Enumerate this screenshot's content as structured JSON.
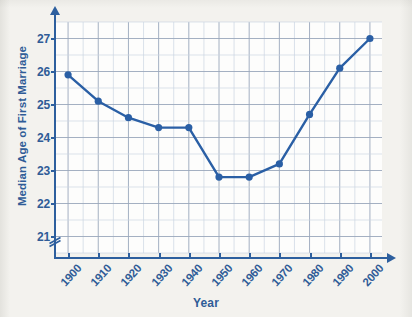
{
  "chart_data": {
    "type": "line",
    "title": "",
    "xlabel": "Year",
    "ylabel": "Median Age of First Marriage",
    "x": [
      1900,
      1910,
      1920,
      1930,
      1940,
      1950,
      1960,
      1970,
      1980,
      1990,
      2000
    ],
    "values": [
      25.9,
      25.1,
      24.6,
      24.3,
      24.3,
      22.8,
      22.8,
      23.2,
      24.7,
      26.1,
      27.0
    ],
    "xtick_labels": [
      "1900",
      "1910",
      "1920",
      "1930",
      "1940",
      "1950",
      "1960",
      "1970",
      "1980",
      "1990",
      "2000"
    ],
    "ytick_labels": [
      "21",
      "22",
      "23",
      "24",
      "25",
      "26",
      "27"
    ],
    "ytick_values": [
      21,
      22,
      23,
      24,
      25,
      26,
      27
    ],
    "xlim": [
      1896,
      2004
    ],
    "ylim": [
      20.5,
      27.5
    ],
    "x_minor_step": 5,
    "y_minor_step": 0.5,
    "grid": true,
    "legend": "none",
    "y_axis_break": true,
    "y_axis_break_symbol": "double-slash",
    "colors": {
      "series_line": "#2a5fa5",
      "marker": "#2a5fa5",
      "axis": "#2d5f9e",
      "label_text": "#2f5c97",
      "grid_major": "#9aa7bb",
      "grid_minor": "#ccd5e2",
      "plot_background": "#fdfdfc",
      "page_background": "#f3f2ee"
    }
  }
}
